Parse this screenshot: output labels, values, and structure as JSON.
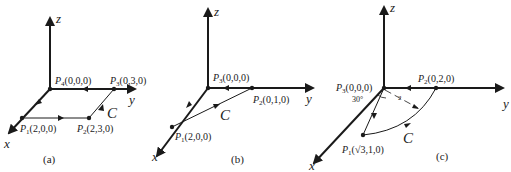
{
  "diagrams": [
    {
      "caption": "(a)",
      "axes": {
        "x": "x",
        "y": "y",
        "z": "z"
      },
      "curve_label": "C",
      "points": [
        {
          "name": "P",
          "sub": "4",
          "coords": "(0,0,0)"
        },
        {
          "name": "P",
          "sub": "3",
          "coords": "(0,3,0)"
        },
        {
          "name": "P",
          "sub": "1",
          "coords": "(2,0,0)"
        },
        {
          "name": "P",
          "sub": "2",
          "coords": "(2,3,0)"
        }
      ]
    },
    {
      "caption": "(b)",
      "axes": {
        "x": "x",
        "y": "y",
        "z": "z"
      },
      "curve_label": "C",
      "points": [
        {
          "name": "P",
          "sub": "3",
          "coords": "(0,0,0)"
        },
        {
          "name": "P",
          "sub": "2",
          "coords": "(0,1,0)"
        },
        {
          "name": "P",
          "sub": "1",
          "coords": "(2,0,0)"
        }
      ]
    },
    {
      "caption": "(c)",
      "axes": {
        "x": "x",
        "y": "y",
        "z": "z"
      },
      "curve_label": "C",
      "angle_label": "30°",
      "radius_label": "2",
      "points": [
        {
          "name": "P",
          "sub": "3",
          "coords": "(0,0,0)"
        },
        {
          "name": "P",
          "sub": "2",
          "coords": "(0,2,0)"
        },
        {
          "name": "P",
          "sub": "1",
          "coords": "(√3,1,0)"
        }
      ]
    }
  ],
  "colors": {
    "ink": "#1a1a1a",
    "background": "#ffffff"
  }
}
